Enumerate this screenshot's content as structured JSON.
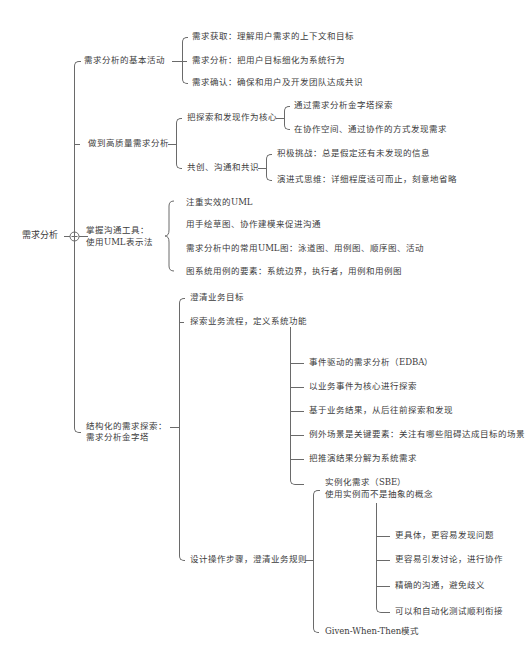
{
  "root": {
    "label": "需求分析",
    "toggle_icon": "collapse-circle"
  },
  "branches": [
    {
      "label": "需求分析的基本活动",
      "children": [
        {
          "label": "需求获取：理解用户需求的上下文和目标"
        },
        {
          "label": "需求分析：把用户目标细化为系统行为"
        },
        {
          "label": "需求确认：确保和用户及开发团队达成共识"
        }
      ]
    },
    {
      "label": "做到高质量需求分析",
      "children": [
        {
          "label": "把探索和发现作为核心",
          "children": [
            {
              "label": "通过需求分析金字塔探索"
            },
            {
              "label": "在协作空间、通过协作的方式发现需求"
            }
          ]
        },
        {
          "label": "共创、沟通和共识",
          "children": [
            {
              "label": "积极挑战：总是假定还有未发现的信息"
            },
            {
              "label": "演进式思维：详细程度适可而止，刻意地省略"
            }
          ]
        }
      ]
    },
    {
      "label_line1": "掌握沟通工具：",
      "label_line2": "使用UML表示法",
      "children": [
        {
          "label": "注重实效的UML"
        },
        {
          "label": "用手绘草图、协作建模来促进沟通"
        },
        {
          "label": "需求分析中的常用UML图：泳道图、用例图、顺序图、活动"
        },
        {
          "label": "图系统用例的要素：系统边界，执行者，用例和用例图"
        }
      ]
    },
    {
      "label_line1": "结构化的需求探索：",
      "label_line2": "需求分析金字塔",
      "children": [
        {
          "label": "澄清业务目标"
        },
        {
          "label": "探索业务流程，定义系统功能",
          "children": [
            {
              "label": "事件驱动的需求分析（EDBA）"
            },
            {
              "label": "以业务事件为核心进行探索"
            },
            {
              "label": "基于业务结果，从后往前探索和发现"
            },
            {
              "label": "例外场景是关键要素：关注有哪些阻碍达成目标的场景"
            },
            {
              "label": "把推演结果分解为系统需求"
            }
          ]
        },
        {
          "label": "设计操作步骤，澄清业务规则",
          "children": [
            {
              "label_line1": "实例化需求（SBE）",
              "label_line2": "使用实例而不是抽象的概念",
              "children": [
                {
                  "label": "更具体，更容易发现问题"
                },
                {
                  "label": "更容易引发讨论，进行协作"
                },
                {
                  "label": "精确的沟通，避免歧义"
                },
                {
                  "label": "可以和自动化测试顺利衔接"
                }
              ]
            },
            {
              "label": "Given-When-Then模式"
            }
          ]
        }
      ]
    }
  ]
}
